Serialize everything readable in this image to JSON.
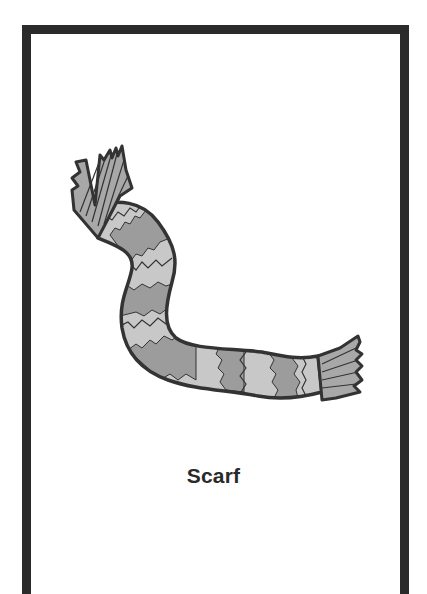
{
  "card": {
    "label": "Scarf",
    "illustration": "scarf-icon",
    "colors": {
      "border": "#2b2b2b",
      "outline": "#333333",
      "stripe_light": "#c8c8c8",
      "stripe_dark": "#9c9c9c",
      "fringe": "#a8a8a8",
      "background": "#ffffff"
    }
  }
}
